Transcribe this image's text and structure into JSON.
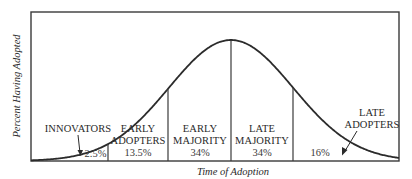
{
  "chart_data": {
    "type": "area",
    "title": "",
    "xlabel": "Time of Adoption",
    "ylabel": "Percent Having Adopted",
    "grid": false,
    "legend": null,
    "categories": [
      "Innovators",
      "Early Adopters",
      "Early Majority",
      "Late Majority",
      "Late Adopters"
    ],
    "values": [
      2.5,
      13.5,
      34,
      34,
      16
    ],
    "unit": "%",
    "segments": [
      {
        "name": "INNOVATORS",
        "lines": [
          "INNOVATORS"
        ],
        "pct": "2.5%",
        "value": 2.5,
        "x_start": 31,
        "x_end": 108
      },
      {
        "name": "EARLY ADOPTERS",
        "lines": [
          "EARLY",
          "ADOPTERS"
        ],
        "pct": "13.5%",
        "value": 13.5,
        "x_start": 108,
        "x_end": 168
      },
      {
        "name": "EARLY MAJORITY",
        "lines": [
          "EARLY",
          "MAJORITY"
        ],
        "pct": "34%",
        "value": 34,
        "x_start": 168,
        "x_end": 231
      },
      {
        "name": "LATE MAJORITY",
        "lines": [
          "LATE",
          "MAJORITY"
        ],
        "pct": "34%",
        "value": 34,
        "x_start": 231,
        "x_end": 293
      },
      {
        "name": "LATE ADOPTERS",
        "lines": [
          "LATE",
          "ADOPTERS"
        ],
        "pct": "16%",
        "value": 16,
        "x_start": 293,
        "x_end": 399
      }
    ],
    "annotations": [
      {
        "text": "INNOVATORS",
        "arrow_to": "2.5% region under left tail"
      },
      {
        "text": "LATE ADOPTERS",
        "arrow_to": "16% region under right tail"
      }
    ],
    "curve": {
      "mean_x": 231,
      "sigma_px": 62,
      "peak_y": 40,
      "baseline_y": 161
    }
  },
  "frame": {
    "left": 31,
    "top": 12,
    "right": 399,
    "bottom": 161
  },
  "labels": {
    "innovators": "INNOVATORS",
    "innovators_pct": "2.5%",
    "early_adopters_1": "EARLY",
    "early_adopters_2": "ADOPTERS",
    "early_adopters_pct": "13.5%",
    "early_majority_1": "EARLY",
    "early_majority_2": "MAJORITY",
    "early_majority_pct": "34%",
    "late_majority_1": "LATE",
    "late_majority_2": "MAJORITY",
    "late_majority_pct": "34%",
    "late_adopters_1": "LATE",
    "late_adopters_2": "ADOPTERS",
    "late_adopters_pct": "16%",
    "x_axis": "Time of Adoption",
    "y_axis": "Percent Having Adopted"
  },
  "colors": {
    "line": "#2b2b2b",
    "frame": "#3a3a3a",
    "text": "#2a2a2a",
    "background": "#ffffff"
  }
}
